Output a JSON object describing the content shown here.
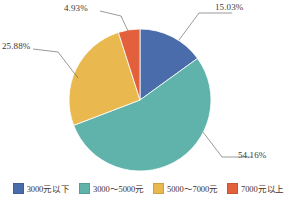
{
  "chart_data": {
    "type": "pie",
    "title": "",
    "xlabel": "",
    "ylabel": "",
    "legend_position": "bottom",
    "grid": false,
    "start_angle_deg": 0,
    "direction": "clockwise",
    "categories": [
      "3000元以下",
      "3000～5000元",
      "5000～7000元",
      "7000元以上"
    ],
    "values": [
      15.03,
      54.16,
      25.88,
      4.93
    ],
    "value_unit": "%",
    "labels": [
      "15.03%",
      "54.16%",
      "25.88%",
      "4.93%"
    ],
    "colors": [
      "#4a6cab",
      "#5fb3ab",
      "#e9b84f",
      "#e2613c"
    ],
    "slices": [
      {
        "name": "3000元以下",
        "label": "15.03%",
        "value": 15.03,
        "color": "#4a6cab"
      },
      {
        "name": "3000～5000元",
        "label": "54.16%",
        "value": 54.16,
        "color": "#5fb3ab"
      },
      {
        "name": "5000～7000元",
        "label": "25.88%",
        "value": 25.88,
        "color": "#e9b84f"
      },
      {
        "name": "7000元以上",
        "label": "4.93%",
        "value": 4.93,
        "color": "#e2613c"
      }
    ]
  },
  "legend": {
    "items": [
      {
        "label": "3000元以下",
        "color": "#4a6cab"
      },
      {
        "label": "3000～5000元",
        "color": "#5fb3ab"
      },
      {
        "label": "5000～7000元",
        "color": "#e9b84f"
      },
      {
        "label": "7000元以上",
        "color": "#e2613c"
      }
    ]
  },
  "geometry": {
    "cx": 140,
    "cy": 100,
    "r": 71
  }
}
